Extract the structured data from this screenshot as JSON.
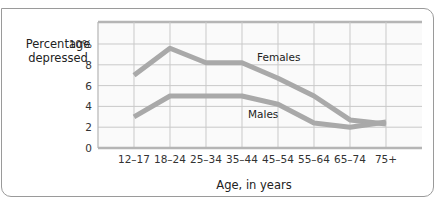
{
  "chart_data": {
    "type": "line",
    "title": "",
    "xlabel": "Age, in years",
    "ylabel": "Percentage depressed",
    "ylabel_lines": [
      "Percentage",
      "depressed"
    ],
    "categories": [
      "12–17",
      "18–24",
      "25–34",
      "35–44",
      "45–54",
      "55–64",
      "65–74",
      "75+"
    ],
    "yticks": [
      "0",
      "2",
      "4",
      "6",
      "8",
      "10%"
    ],
    "ylim": [
      0,
      12
    ],
    "grid": true,
    "legend_position": "inline labels",
    "series": [
      {
        "name": "Females",
        "values": [
          7.0,
          9.6,
          8.2,
          8.2,
          6.7,
          5.0,
          2.7,
          2.3
        ],
        "color": "#a9a9a9"
      },
      {
        "name": "Males",
        "values": [
          3.0,
          5.0,
          5.0,
          5.0,
          4.2,
          2.4,
          2.0,
          2.5
        ],
        "color": "#a9a9a9"
      }
    ]
  },
  "colors": {
    "line": "#a9a9a9",
    "grid": "#c9c9c9",
    "plot_bg": "#fafafa",
    "axis": "#b5b5b5"
  }
}
